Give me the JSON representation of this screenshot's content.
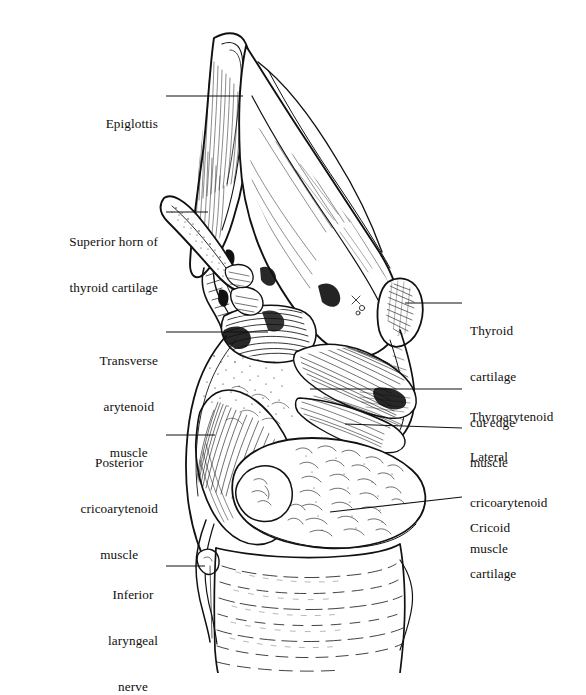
{
  "figure": {
    "view": "posterior",
    "style": "pen-and-ink line engraving",
    "background_color": "#ffffff",
    "ink_color": "#111111",
    "width": 586,
    "height": 673
  },
  "labels": [
    {
      "id": "epiglottis",
      "text": "Epiglottis",
      "side": "left",
      "align": "right",
      "lines": [
        "Epiglottis"
      ],
      "text_right_x": 158,
      "text_top_y": 85,
      "leader": {
        "from_x": 166,
        "from_y": 96,
        "to_x": 243,
        "to_y": 96
      }
    },
    {
      "id": "superior-horn-of-thyroid-cartilage",
      "text": "Superior horn of thyroid cartilage",
      "side": "left",
      "align": "right",
      "lines": [
        "Superior horn of",
        "thyroid cartilage"
      ],
      "text_right_x": 158,
      "text_top_y": 203,
      "leader": {
        "from_x": 166,
        "from_y": 212,
        "to_x": 208,
        "to_y": 212
      }
    },
    {
      "id": "transverse-arytenoid-muscle",
      "text": "Transverse arytenoid muscle",
      "side": "left",
      "align": "center",
      "lines": [
        "Transverse",
        "arytenoid",
        "muscle"
      ],
      "text_right_x": 158,
      "text_top_y": 322,
      "leader": {
        "from_x": 166,
        "from_y": 332,
        "to_x": 268,
        "to_y": 332
      }
    },
    {
      "id": "posterior-cricoarytenoid-muscle",
      "text": "Posterior cricoarytenoid muscle",
      "side": "left",
      "align": "center",
      "lines": [
        "Posterior",
        "cricoarytenoid",
        "muscle"
      ],
      "text_right_x": 158,
      "text_top_y": 424,
      "leader": {
        "from_x": 166,
        "from_y": 435,
        "to_x": 215,
        "to_y": 435
      }
    },
    {
      "id": "inferior-laryngeal-nerve",
      "text": "Inferior laryngeal nerve",
      "side": "left",
      "align": "center",
      "lines": [
        "Inferior",
        "laryngeal",
        "nerve"
      ],
      "text_right_x": 158,
      "text_top_y": 556,
      "leader": {
        "from_x": 166,
        "from_y": 566,
        "to_x": 205,
        "to_y": 566
      }
    },
    {
      "id": "thyroid-cartilage-cut-edge",
      "text": "Thyroid cartilage cut edge",
      "side": "right",
      "align": "left",
      "lines": [
        "Thyroid",
        "cartilage",
        "cut edge"
      ],
      "text_left_x": 470,
      "text_top_y": 292,
      "leader": {
        "from_x": 462,
        "from_y": 303,
        "to_x": 405,
        "to_y": 303
      }
    },
    {
      "id": "thyroarytenoid-muscle",
      "text": "Thyroarytenoid muscle",
      "side": "right",
      "align": "left",
      "lines": [
        "Thyroarytenoid",
        "muscle"
      ],
      "text_left_x": 470,
      "text_top_y": 378,
      "leader": {
        "from_x": 462,
        "from_y": 389,
        "to_x": 310,
        "to_y": 389
      }
    },
    {
      "id": "lateral-cricoarytenoid-muscle",
      "text": "Lateral cricoarytenoid muscle",
      "side": "right",
      "align": "left",
      "lines": [
        "Lateral",
        "cricoarytenoid",
        "muscle"
      ],
      "text_left_x": 470,
      "text_top_y": 418,
      "leader": {
        "from_x": 462,
        "from_y": 428,
        "to_x": 345,
        "to_y": 424
      }
    },
    {
      "id": "cricoid-cartilage",
      "text": "Cricoid cartilage",
      "side": "right",
      "align": "left",
      "lines": [
        "Cricoid",
        "cartilage"
      ],
      "text_left_x": 470,
      "text_top_y": 489,
      "leader": {
        "from_x": 462,
        "from_y": 497,
        "to_x": 330,
        "to_y": 512
      }
    }
  ],
  "structures": [
    {
      "id": "epiglottis",
      "name": "Epiglottis"
    },
    {
      "id": "superior-horn",
      "name": "Superior horn of thyroid cartilage"
    },
    {
      "id": "thyroid-lamina",
      "name": "Thyroid cartilage lamina"
    },
    {
      "id": "thyroid-cut-edge",
      "name": "Thyroid cartilage cut edge"
    },
    {
      "id": "transverse-arytenoid",
      "name": "Transverse arytenoid muscle"
    },
    {
      "id": "posterior-cricoarytenoid",
      "name": "Posterior cricoarytenoid muscle"
    },
    {
      "id": "thyroarytenoid",
      "name": "Thyroarytenoid muscle"
    },
    {
      "id": "lateral-cricoarytenoid",
      "name": "Lateral cricoarytenoid muscle"
    },
    {
      "id": "cricoid-cartilage",
      "name": "Cricoid cartilage"
    },
    {
      "id": "inferior-laryngeal-nerve",
      "name": "Inferior laryngeal nerve"
    },
    {
      "id": "trachea",
      "name": "Trachea"
    }
  ]
}
